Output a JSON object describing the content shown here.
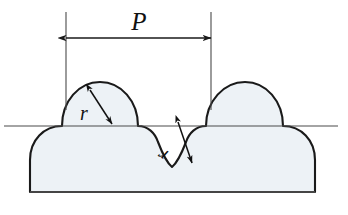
{
  "figure": {
    "background_color": "#ffffff",
    "outline_color": "#1a1a1a",
    "fill_color": "#edf2f6",
    "thin_line_color": "#4a4a4a"
  },
  "labels": {
    "pitch": "P",
    "radius_crest": "r",
    "radius_root": "r"
  },
  "dimension": {
    "name": "pitch-dimension",
    "label": "P",
    "extension_left_x": 66,
    "extension_right_x": 211,
    "extension_top_y": 12,
    "extension_bottom_y": 110,
    "dim_line_y": 38,
    "arrow_style": "double-headed-filled"
  },
  "centerline": {
    "name": "reference-centerline",
    "y": 126,
    "x_start": 4,
    "x_end": 338
  },
  "geometry": {
    "pitch_px": 145,
    "crest_radius_px": 44,
    "root_radius_px": 32,
    "base_top_y": 126,
    "base_bottom_y": 192,
    "base_left_x": 30,
    "base_right_x": 325,
    "crest_apex_y": 82,
    "crest1_center_x": 100,
    "crest2_center_x": 245,
    "root_center_x": 172
  },
  "callouts": [
    {
      "name": "crest-radius-callout",
      "label": "r",
      "label_x": 84,
      "label_y": 119,
      "arrow_from_x": 90,
      "arrow_from_y": 90,
      "arrow_to_x": 112,
      "arrow_to_y": 124
    },
    {
      "name": "root-radius-callout",
      "label": "r",
      "label_x": 163,
      "label_y": 148,
      "label_rotation": -150,
      "arrow_from_x": 178,
      "arrow_from_y": 122,
      "arrow_to_x": 192,
      "arrow_to_y": 163
    }
  ]
}
